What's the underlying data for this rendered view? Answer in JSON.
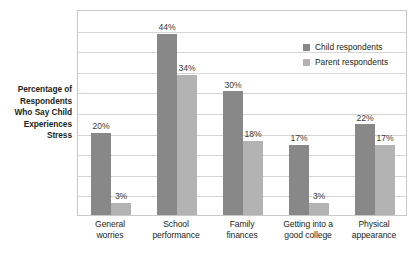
{
  "chart_data": {
    "type": "bar",
    "title": "",
    "xlabel": "",
    "ylabel": "Percentage of Respondents Who Say Child Experiences Stress",
    "ylabel_lines": [
      "Percentage of",
      "Respondents",
      "Who Say Child",
      "Experiences",
      "Stress"
    ],
    "categories": [
      "General worries",
      "School performance",
      "Family finances",
      "Getting into a good college",
      "Physical appearance"
    ],
    "category_lines": [
      [
        "General",
        "worries"
      ],
      [
        "School",
        "performance"
      ],
      [
        "Family",
        "finances"
      ],
      [
        "Getting into a",
        "good college"
      ],
      [
        "Physical",
        "appearance"
      ]
    ],
    "series": [
      {
        "name": "Child respondents",
        "color": "#888889",
        "values": [
          20,
          44,
          30,
          17,
          22
        ],
        "labels": [
          "20%",
          "44%",
          "30%",
          "17%",
          "22%"
        ]
      },
      {
        "name": "Parent respondents",
        "color": "#b3b3b4",
        "values": [
          3,
          34,
          18,
          3,
          17
        ],
        "labels": [
          "3%",
          "34%",
          "18%",
          "3%",
          "17%"
        ]
      }
    ],
    "ylim": [
      0,
      50
    ],
    "ytick_interval": 5,
    "ytick_labels": [],
    "grid": true,
    "legend_position": "top-right",
    "legend": [
      "Child respondents",
      "Parent respondents"
    ]
  },
  "legend": {
    "items": [
      {
        "label": "Child respondents"
      },
      {
        "label": "Parent respondents"
      }
    ]
  }
}
